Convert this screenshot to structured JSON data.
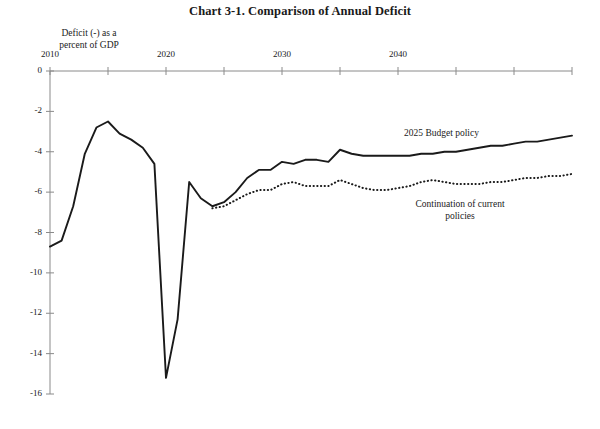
{
  "title": "Chart 3-1.  Comparison of Annual Deficit",
  "axis_label_line1": "Deficit (-) as a",
  "axis_label_line2": "percent of GDP",
  "label_budget": "2025 Budget policy",
  "label_current_line1": "Continuation of current",
  "label_current_line2": "policies",
  "colors": {
    "line": "#1a1a1a",
    "axis": "#8a8a8a",
    "background": "#ffffff"
  },
  "chart_data": {
    "type": "line",
    "title": "Chart 3-1.  Comparison of Annual Deficit",
    "subtitle": "",
    "xlabel": "",
    "ylabel": "Deficit (-) as a percent of GDP",
    "xlim": [
      2010,
      2055
    ],
    "ylim": [
      -16,
      0
    ],
    "grid": false,
    "legend": "inline-annotations",
    "y_ticks": [
      0,
      -2,
      -4,
      -6,
      -8,
      -10,
      -12,
      -14,
      -16
    ],
    "y_tick_labels": [
      "0",
      "-2",
      "-4",
      "-6",
      "-8",
      "-10",
      "-12",
      "-14",
      "-16"
    ],
    "x_ticks": [
      2010,
      2015,
      2020,
      2025,
      2030,
      2035,
      2040,
      2045,
      2050,
      2055
    ],
    "x_tick_labels": [
      "2010",
      "",
      "2020",
      "",
      "2030",
      "",
      "2040",
      "",
      "",
      ""
    ],
    "x": [
      2010,
      2011,
      2012,
      2013,
      2014,
      2015,
      2016,
      2017,
      2018,
      2019,
      2020,
      2021,
      2022,
      2023,
      2024,
      2025,
      2026,
      2027,
      2028,
      2029,
      2030,
      2031,
      2032,
      2033,
      2034,
      2035,
      2036,
      2037,
      2038,
      2039,
      2040,
      2041,
      2042,
      2043,
      2044,
      2045,
      2046,
      2047,
      2048,
      2049,
      2050,
      2051,
      2052,
      2053,
      2054,
      2055
    ],
    "series": [
      {
        "name": "2025 Budget policy",
        "style": "solid",
        "values": [
          -8.7,
          -8.4,
          -6.7,
          -4.1,
          -2.8,
          -2.5,
          -3.1,
          -3.4,
          -3.8,
          -4.6,
          -15.2,
          -12.3,
          -5.5,
          -6.3,
          -6.7,
          -6.5,
          -6.0,
          -5.3,
          -4.9,
          -4.9,
          -4.5,
          -4.6,
          -4.4,
          -4.4,
          -4.5,
          -3.9,
          -4.1,
          -4.2,
          -4.2,
          -4.2,
          -4.2,
          -4.2,
          -4.1,
          -4.1,
          -4.0,
          -4.0,
          -3.9,
          -3.8,
          -3.7,
          -3.7,
          -3.6,
          -3.5,
          -3.5,
          -3.4,
          -3.3,
          -3.2
        ]
      },
      {
        "name": "Continuation of current policies",
        "style": "dotted",
        "values": [
          null,
          null,
          null,
          null,
          null,
          null,
          null,
          null,
          null,
          null,
          null,
          null,
          null,
          null,
          -6.8,
          -6.7,
          -6.4,
          -6.1,
          -5.9,
          -5.9,
          -5.6,
          -5.5,
          -5.7,
          -5.7,
          -5.7,
          -5.4,
          -5.6,
          -5.8,
          -5.9,
          -5.9,
          -5.8,
          -5.7,
          -5.5,
          -5.4,
          -5.5,
          -5.6,
          -5.6,
          -5.6,
          -5.5,
          -5.5,
          -5.4,
          -5.3,
          -5.3,
          -5.2,
          -5.2,
          -5.1
        ]
      }
    ],
    "annotations": [
      {
        "text": "2025 Budget policy",
        "x": 2041,
        "y": -3.0
      },
      {
        "text": "Continuation of current policies",
        "x": 2040,
        "y": -6.5
      }
    ]
  }
}
